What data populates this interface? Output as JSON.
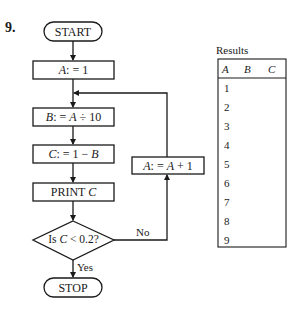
{
  "problem_number": "9.",
  "flowchart": {
    "start": "START",
    "init": {
      "var": "A",
      "op": ": = 1"
    },
    "step_b": {
      "var": "B",
      "op": ": =",
      "expr_var": "A",
      "expr_rest": "÷ 10"
    },
    "step_c": {
      "var": "C",
      "op": ": = 1 −",
      "expr_var": "B"
    },
    "print": {
      "label": "PRINT",
      "var": "C"
    },
    "decision": {
      "prefix": "Is",
      "var": "C",
      "rest": "< 0.2?"
    },
    "yes_label": "Yes",
    "no_label": "No",
    "increment": {
      "var": "A",
      "op": ": =",
      "expr_var": "A",
      "expr_rest": "+ 1"
    },
    "stop": "STOP"
  },
  "results_table": {
    "title": "Results",
    "headers": [
      "A",
      "B",
      "C"
    ],
    "rows": [
      {
        "A": "1",
        "B": "",
        "C": ""
      },
      {
        "A": "2",
        "B": "",
        "C": ""
      },
      {
        "A": "3",
        "B": "",
        "C": ""
      },
      {
        "A": "4",
        "B": "",
        "C": ""
      },
      {
        "A": "5",
        "B": "",
        "C": ""
      },
      {
        "A": "6",
        "B": "",
        "C": ""
      },
      {
        "A": "7",
        "B": "",
        "C": ""
      },
      {
        "A": "8",
        "B": "",
        "C": ""
      },
      {
        "A": "9",
        "B": "",
        "C": ""
      }
    ]
  }
}
